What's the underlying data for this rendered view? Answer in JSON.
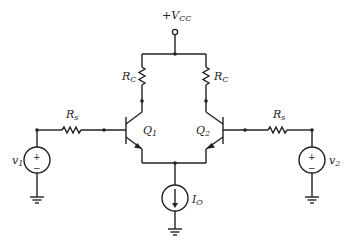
{
  "labels": {
    "vcc": "+V",
    "vcc_sub": "CC",
    "rc_left": "R",
    "rc_left_sub": "C",
    "rc_right": "R",
    "rc_right_sub": "C",
    "rs_left": "R",
    "rs_left_sub": "s",
    "rs_right": "R",
    "rs_right_sub": "s",
    "q1": "Q",
    "q1_sub": "1",
    "q2": "Q",
    "q2_sub": "2",
    "v1": "v",
    "v1_sub": "1",
    "v2": "v",
    "v2_sub": "2",
    "io": "I",
    "io_sub": "O",
    "plus": "+",
    "minus": "−"
  },
  "components": [
    {
      "id": "Vcc",
      "type": "supply-terminal"
    },
    {
      "id": "RC1",
      "type": "resistor"
    },
    {
      "id": "RC2",
      "type": "resistor"
    },
    {
      "id": "Q1",
      "type": "npn-bjt"
    },
    {
      "id": "Q2",
      "type": "npn-bjt"
    },
    {
      "id": "Rs1",
      "type": "resistor"
    },
    {
      "id": "Rs2",
      "type": "resistor"
    },
    {
      "id": "v1",
      "type": "voltage-source"
    },
    {
      "id": "v2",
      "type": "voltage-source"
    },
    {
      "id": "IO",
      "type": "current-source"
    }
  ]
}
